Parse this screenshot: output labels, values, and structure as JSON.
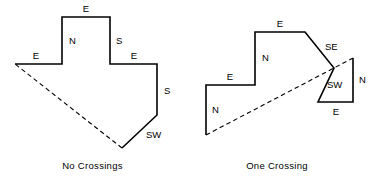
{
  "figure": {
    "panels": [
      {
        "id": "no-crossings",
        "caption": "No Crossings",
        "solid_path": "M 15,64 L 62,64 L 62,17 L 110,17 L 110,64 L 157,64 L 157,115 L 122,148",
        "dashed_path": "M 122,148 L 15,64",
        "labels": [
          {
            "text": "E",
            "x": 36,
            "y": 56,
            "anchor": "middle"
          },
          {
            "text": "N",
            "x": 69,
            "y": 41,
            "anchor": "start"
          },
          {
            "text": "E",
            "x": 86,
            "y": 9,
            "anchor": "middle"
          },
          {
            "text": "S",
            "x": 116,
            "y": 41,
            "anchor": "start"
          },
          {
            "text": "E",
            "x": 134,
            "y": 56,
            "anchor": "middle"
          },
          {
            "text": "S",
            "x": 164,
            "y": 91,
            "anchor": "start"
          },
          {
            "text": "SW",
            "x": 146,
            "y": 135,
            "anchor": "start"
          }
        ]
      },
      {
        "id": "one-crossing",
        "caption": "One Crossing",
        "solid_path": "M 206,135 L 206,85 L 255,85 L 255,32 L 305,32 L 334,68 L 318,102 L 353,102 L 353,58",
        "dashed_path": "M 206,135 L 353,58",
        "labels": [
          {
            "text": "N",
            "x": 212,
            "y": 110,
            "anchor": "start"
          },
          {
            "text": "E",
            "x": 230,
            "y": 77,
            "anchor": "middle"
          },
          {
            "text": "N",
            "x": 262,
            "y": 58,
            "anchor": "start"
          },
          {
            "text": "E",
            "x": 280,
            "y": 24,
            "anchor": "middle"
          },
          {
            "text": "SE",
            "x": 325,
            "y": 47,
            "anchor": "start"
          },
          {
            "text": "SW",
            "x": 327,
            "y": 85,
            "anchor": "start"
          },
          {
            "text": "E",
            "x": 336,
            "y": 112,
            "anchor": "middle"
          },
          {
            "text": "N",
            "x": 359,
            "y": 80,
            "anchor": "start"
          }
        ]
      }
    ]
  }
}
